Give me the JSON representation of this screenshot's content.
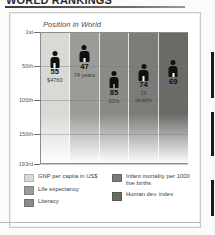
{
  "article": {
    "headline": "WORLD RANKINGS"
  },
  "figure": {
    "subtitle": "Position in World",
    "axis": {
      "ticks": [
        "1st",
        "50th",
        "100th",
        "150th",
        "193rd"
      ]
    }
  },
  "legend": {
    "left": [
      {
        "label": "GNP per capita in US$",
        "color": "#d9d9d6"
      },
      {
        "label": "Life expectancy",
        "color": "#9b9b98"
      },
      {
        "label": "Literacy",
        "color": "#8a8a87"
      }
    ],
    "right": [
      {
        "label": "Infant mortality per 1000 live births",
        "color": "#7b7b78"
      },
      {
        "label": "Human dev. index",
        "color": "#6a6a67"
      }
    ]
  },
  "chart_data": {
    "type": "bar",
    "title": "Position in World",
    "xlabel": "",
    "ylabel": "Position in World",
    "ylim": [
      1,
      193
    ],
    "grid": true,
    "legend_position": "below",
    "ytick_labels": [
      "1st",
      "50th",
      "100th",
      "150th",
      "193rd"
    ],
    "ytick_values": [
      1,
      50,
      100,
      150,
      193
    ],
    "categories": [
      "GNP per capita in US$",
      "Life expectancy",
      "Literacy",
      "Infant mortality per 1000 live births",
      "Human dev. index"
    ],
    "values": [
      55,
      47,
      85,
      74,
      69
    ],
    "value_labels": [
      "55",
      "47",
      "85",
      "74",
      "69"
    ],
    "detail_labels": [
      "$4760",
      "74 years",
      "93%",
      "19 deaths",
      ""
    ],
    "column_colors": [
      "#d9d9d6",
      "#9b9b98",
      "#8a8a87",
      "#7b7b78",
      "#6a6a67"
    ]
  }
}
